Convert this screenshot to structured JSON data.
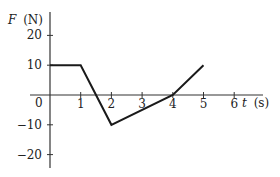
{
  "chart_data": {
    "type": "line",
    "title": "",
    "xlabel": "t (s)",
    "ylabel": "F (N)",
    "xlabel_var": "t",
    "xlabel_unit": "(s)",
    "ylabel_var": "F",
    "ylabel_unit": "(N)",
    "x_ticks": [
      "1",
      "2",
      "3",
      "4",
      "5",
      "6"
    ],
    "y_ticks": [
      "20",
      "10",
      "-10",
      "-20"
    ],
    "origin_label": "0",
    "xlim": [
      0,
      6.9
    ],
    "ylim": [
      -25,
      27
    ],
    "grid": false,
    "legend": null,
    "series": [
      {
        "name": "F(t)",
        "x": [
          0,
          1,
          2,
          4,
          5
        ],
        "y": [
          10,
          10,
          -10,
          0,
          10
        ]
      }
    ],
    "line_color": "#1a1a1a"
  }
}
